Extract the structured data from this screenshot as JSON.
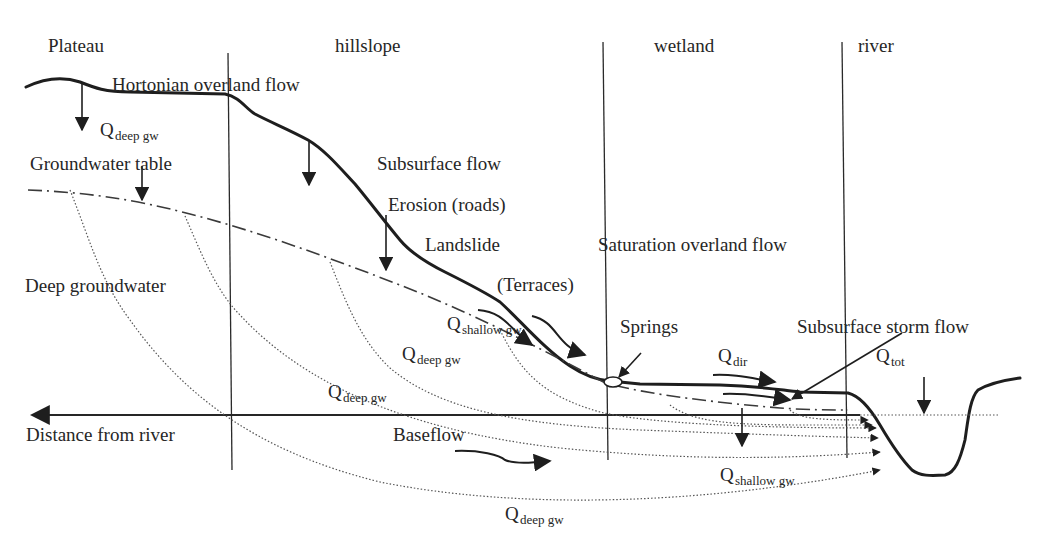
{
  "zones": [
    {
      "label": "Plateau"
    },
    {
      "label": "hillslope"
    },
    {
      "label": "wetland"
    },
    {
      "label": "river"
    }
  ],
  "processes": {
    "hortonian": "Hortonian overland flow",
    "gw_table": "Groundwater table",
    "subsurface_flow": "Subsurface flow",
    "erosion": "Erosion (roads)",
    "landslide": "Landslide",
    "terraces": "(Terraces)",
    "saturation": "Saturation overland flow",
    "deep_gw": "Deep groundwater",
    "springs": "Springs",
    "storm_flow": "Subsurface storm flow",
    "baseflow": "Baseflow",
    "axis_label": "Distance from river"
  },
  "fluxes": {
    "q": "Q",
    "deep_gw_sub": "deep gw",
    "shallow_gw_sub": "shallow gw",
    "dir_sub": "dir",
    "tot_sub": "tot"
  },
  "colors": {
    "ink": "#262626",
    "background": "#ffffff"
  }
}
